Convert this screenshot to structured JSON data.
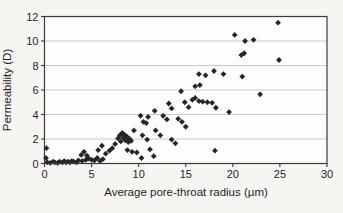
{
  "page": {
    "background": "#f6f5f2"
  },
  "chart_data": {
    "type": "scatter",
    "title": "",
    "xlabel": "Average pore-throat radius (μm)",
    "ylabel": "Permeability (D)",
    "xlim": [
      0,
      30
    ],
    "ylim": [
      0,
      12
    ],
    "xticks": [
      0,
      5,
      10,
      15,
      20,
      25,
      30
    ],
    "yticks": [
      0,
      2,
      4,
      6,
      8,
      10,
      12
    ],
    "grid": "horizontal",
    "legend": "none",
    "marker": "diamond",
    "colors": {
      "marker": "#262626",
      "grid": "#bdbdbd",
      "frame": "#3a3a3a",
      "text": "#1f1f1f",
      "plot_background": "#fdfdfc"
    },
    "points": [
      [
        0.15,
        0.45
      ],
      [
        0.2,
        1.25
      ],
      [
        0.3,
        0.1
      ],
      [
        0.6,
        0.05
      ],
      [
        0.9,
        0.15
      ],
      [
        1.1,
        0.1
      ],
      [
        1.4,
        0.05
      ],
      [
        1.6,
        0.15
      ],
      [
        1.9,
        0.1
      ],
      [
        2.1,
        0.2
      ],
      [
        2.3,
        0.1
      ],
      [
        2.5,
        0.15
      ],
      [
        2.7,
        0.1
      ],
      [
        2.9,
        0.2
      ],
      [
        3.1,
        0.15
      ],
      [
        3.4,
        0.1
      ],
      [
        3.6,
        0.25
      ],
      [
        3.9,
        0.7
      ],
      [
        4.0,
        0.2
      ],
      [
        4.2,
        0.95
      ],
      [
        4.4,
        0.3
      ],
      [
        4.5,
        0.65
      ],
      [
        4.7,
        0.4
      ],
      [
        5.0,
        0.3
      ],
      [
        5.3,
        0.25
      ],
      [
        5.6,
        0.45
      ],
      [
        5.7,
        1.1
      ],
      [
        5.9,
        0.2
      ],
      [
        6.1,
        1.45
      ],
      [
        6.2,
        0.35
      ],
      [
        6.5,
        0.8
      ],
      [
        6.9,
        1.05
      ],
      [
        7.2,
        1.25
      ],
      [
        7.5,
        1.6
      ],
      [
        7.8,
        2.05
      ],
      [
        8.0,
        2.3
      ],
      [
        8.1,
        1.8
      ],
      [
        8.25,
        2.5
      ],
      [
        8.35,
        2.1
      ],
      [
        8.5,
        2.35
      ],
      [
        8.6,
        1.9
      ],
      [
        8.75,
        2.2
      ],
      [
        8.9,
        1.75
      ],
      [
        9.05,
        2.0
      ],
      [
        9.2,
        1.85
      ],
      [
        8.8,
        1.1
      ],
      [
        9.3,
        0.95
      ],
      [
        9.5,
        2.7
      ],
      [
        9.8,
        0.9
      ],
      [
        10.2,
        3.9
      ],
      [
        10.3,
        0.45
      ],
      [
        10.4,
        2.3
      ],
      [
        10.5,
        3.4
      ],
      [
        10.8,
        3.3
      ],
      [
        10.9,
        1.95
      ],
      [
        11.0,
        3.8
      ],
      [
        11.2,
        1.15
      ],
      [
        11.6,
        0.6
      ],
      [
        11.7,
        4.3
      ],
      [
        11.8,
        2.7
      ],
      [
        12.3,
        2.3
      ],
      [
        12.6,
        3.9
      ],
      [
        13.0,
        3.6
      ],
      [
        13.2,
        4.9
      ],
      [
        13.5,
        4.5
      ],
      [
        13.5,
        1.95
      ],
      [
        13.9,
        1.65
      ],
      [
        14.2,
        3.65
      ],
      [
        14.5,
        5.9
      ],
      [
        14.6,
        3.4
      ],
      [
        14.9,
        5.0
      ],
      [
        15.0,
        3.0
      ],
      [
        15.3,
        4.6
      ],
      [
        15.7,
        5.2
      ],
      [
        16.0,
        5.35
      ],
      [
        16.4,
        5.1
      ],
      [
        16.8,
        5.05
      ],
      [
        17.3,
        5.0
      ],
      [
        17.8,
        4.95
      ],
      [
        18.2,
        4.55
      ],
      [
        19.6,
        4.2
      ],
      [
        16.0,
        6.3
      ],
      [
        16.5,
        6.4
      ],
      [
        16.4,
        7.3
      ],
      [
        17.1,
        7.2
      ],
      [
        18.0,
        7.55
      ],
      [
        19.0,
        7.3
      ],
      [
        21.0,
        7.1
      ],
      [
        18.1,
        1.05
      ],
      [
        20.2,
        10.5
      ],
      [
        21.3,
        10.0
      ],
      [
        22.2,
        10.1
      ],
      [
        20.9,
        8.85
      ],
      [
        21.2,
        9.0
      ],
      [
        22.9,
        5.65
      ],
      [
        24.8,
        11.5
      ],
      [
        24.9,
        8.45
      ]
    ]
  }
}
